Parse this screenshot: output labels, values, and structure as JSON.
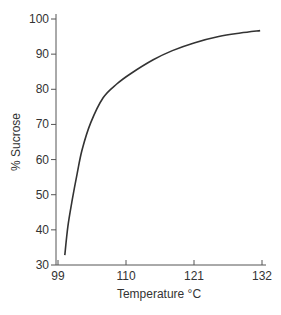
{
  "chart_data": {
    "type": "line",
    "title": "",
    "xlabel": "Temperature °C",
    "ylabel": "% Sucrose",
    "xlim": [
      99,
      132
    ],
    "ylim": [
      30,
      100
    ],
    "x_ticks": [
      99,
      110,
      121,
      132
    ],
    "y_ticks": [
      30,
      40,
      50,
      60,
      70,
      80,
      90,
      100
    ],
    "grid": false,
    "legend": null,
    "series": [
      {
        "name": "Sucrose concentration vs boiling temperature",
        "x": [
          100.1,
          100.6,
          101.3,
          102.1,
          102.9,
          104.3,
          106.3,
          108.5,
          110.8,
          114.4,
          117.5,
          121.0,
          125.0,
          128.5,
          131.7
        ],
        "y": [
          32.8,
          41.0,
          48.5,
          56.0,
          62.8,
          70.5,
          77.6,
          81.5,
          84.5,
          88.4,
          91.0,
          93.2,
          95.0,
          96.0,
          96.7
        ]
      }
    ]
  },
  "colors": {
    "axis": "#555555",
    "line": "#333333",
    "text": "#333333"
  }
}
